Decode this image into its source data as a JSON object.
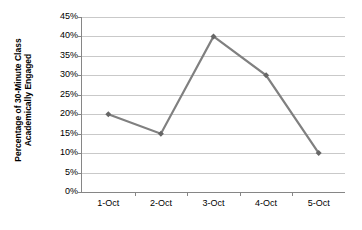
{
  "chart_data": {
    "type": "line",
    "title": "",
    "xlabel": "",
    "ylabel": "Percentage of 30-Minute Class Academically Engaged",
    "ylabel_line1": "Percentage of 30-Minute Class",
    "ylabel_line2": "Academically Engaged",
    "categories": [
      "1-Oct",
      "2-Oct",
      "3-Oct",
      "4-Oct",
      "5-Oct"
    ],
    "values": [
      20,
      15,
      40,
      30,
      10
    ],
    "value_labels": [
      "20%",
      "15%",
      "40%",
      "30%",
      "10%"
    ],
    "ylim": [
      0,
      45
    ],
    "ytick_values": [
      0,
      5,
      10,
      15,
      20,
      25,
      30,
      35,
      40,
      45
    ],
    "ytick_labels": [
      "0%",
      "5%",
      "10%",
      "15%",
      "20%",
      "25%",
      "30%",
      "35%",
      "40%",
      "45%"
    ],
    "grid": true,
    "grid_axis": "y",
    "legend": false,
    "legend_position": "none",
    "line_color": "#808080",
    "marker_color": "#666666",
    "marker": "diamond",
    "gridline_color": "#c9c9c9",
    "axis_color": "#868686",
    "background_color": "#ffffff"
  }
}
